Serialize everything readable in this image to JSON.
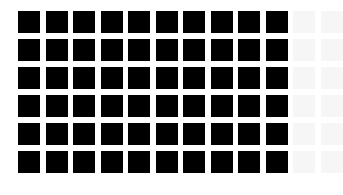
{
  "grid": {
    "rows": 6,
    "columns": 12,
    "origin_x": 18,
    "origin_y": 11,
    "pitch_x": 27.5,
    "pitch_y": 28,
    "cell_size": 22,
    "filled_columns": 10,
    "filled_color": "#000000",
    "faint_color": "#f6f6f6",
    "background": "#ffffff"
  }
}
